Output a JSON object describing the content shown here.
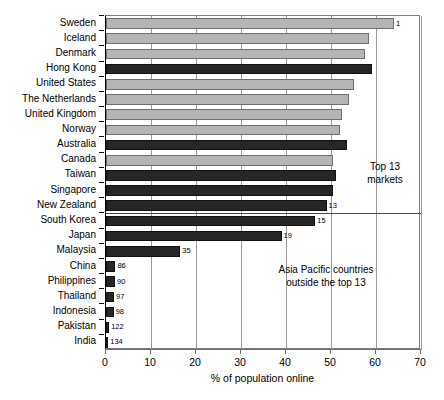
{
  "chart_data": {
    "type": "bar",
    "orientation": "horizontal",
    "title": "",
    "xlabel": "% of population online",
    "ylabel": "",
    "xlim": [
      0,
      70
    ],
    "xticks": [
      0,
      10,
      20,
      30,
      40,
      50,
      60,
      70
    ],
    "grid": true,
    "grid_axis": "x",
    "legend": null,
    "colors": {
      "highlight": "#262626",
      "other": "#b5b5b5"
    },
    "categories": [
      "Sweden",
      "Iceland",
      "Denmark",
      "Hong Kong",
      "United States",
      "The Netherlands",
      "United Kingdom",
      "Norway",
      "Australia",
      "Canada",
      "Taiwan",
      "Singapore",
      "New Zealand",
      "South Korea",
      "Japan",
      "Malaysia",
      "China",
      "Philippines",
      "Thailand",
      "Indonesia",
      "Pakistan",
      "India"
    ],
    "values": [
      64.0,
      58.5,
      57.5,
      59.0,
      55.0,
      54.0,
      52.5,
      52.0,
      53.5,
      50.5,
      51.0,
      50.5,
      49.0,
      46.5,
      39.0,
      16.5,
      2.1,
      2.0,
      1.8,
      1.7,
      0.7,
      0.5
    ],
    "highlight": [
      false,
      false,
      false,
      true,
      false,
      false,
      false,
      false,
      true,
      false,
      true,
      true,
      true,
      true,
      true,
      true,
      true,
      true,
      true,
      true,
      true,
      true
    ],
    "point_labels": [
      "1",
      "",
      "",
      "",
      "",
      "",
      "",
      "",
      "",
      "",
      "",
      "",
      "13",
      "15",
      "19",
      "35",
      "86",
      "90",
      "97",
      "98",
      "122",
      "134"
    ],
    "annotations": [
      {
        "text": "Top 13\nmarkets"
      },
      {
        "text": "Asia Pacific countries\noutside the top 13"
      }
    ],
    "divider_after_category": "New Zealand"
  },
  "axis": {
    "x_title": "% of population online",
    "tick_labels": [
      "0",
      "10",
      "20",
      "30",
      "40",
      "50",
      "60",
      "70"
    ]
  },
  "annotations": {
    "top13": "Top 13\nmarkets",
    "asia_pacific": "Asia Pacific countries\noutside the top 13"
  }
}
